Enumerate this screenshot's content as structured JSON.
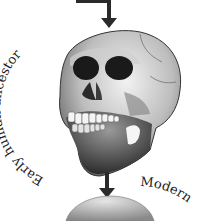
{
  "diagram": {
    "labels": {
      "early_ancestor": "Early human ancestor",
      "modern_partial": "Modern"
    },
    "nodes": [
      {
        "id": "early-human-skull",
        "label": "Early human ancestor"
      },
      {
        "id": "modern-human-skull",
        "label": "Modern"
      }
    ],
    "edges": [
      {
        "from": "previous-stage",
        "to": "early-human-skull"
      },
      {
        "from": "early-human-skull",
        "to": "modern-human-skull"
      }
    ],
    "colors": {
      "arrow": "#2a2a2a",
      "text": "#222222",
      "skull_light": "#d9d9d9",
      "skull_dark": "#3a3a3a",
      "background": "#ffffff"
    }
  }
}
